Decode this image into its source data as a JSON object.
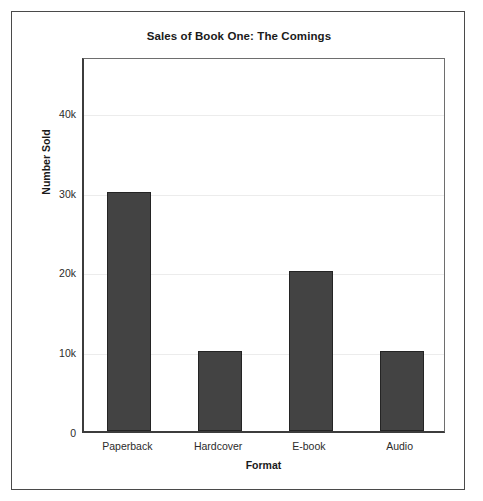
{
  "figure": {
    "background": "#ffffff",
    "frame_color": "#4a4a4a"
  },
  "chart_data": {
    "type": "bar",
    "title": "Sales of Book One: The Comings",
    "xlabel": "Format",
    "ylabel": "Number Sold",
    "categories": [
      "Paperback",
      "Hardcover",
      "E-book",
      "Audio"
    ],
    "values": [
      30000,
      10000,
      20000,
      10000
    ],
    "ytick_labels": [
      "0",
      "10k",
      "20k",
      "30k",
      "40k"
    ],
    "ytick_values": [
      0,
      10000,
      20000,
      30000,
      40000
    ],
    "ylim": [
      0,
      47000
    ],
    "grid": "horizontal",
    "legend": "none",
    "bar_color": "#434343",
    "bar_edge_color": "#242424",
    "grid_color": "#ececec"
  }
}
